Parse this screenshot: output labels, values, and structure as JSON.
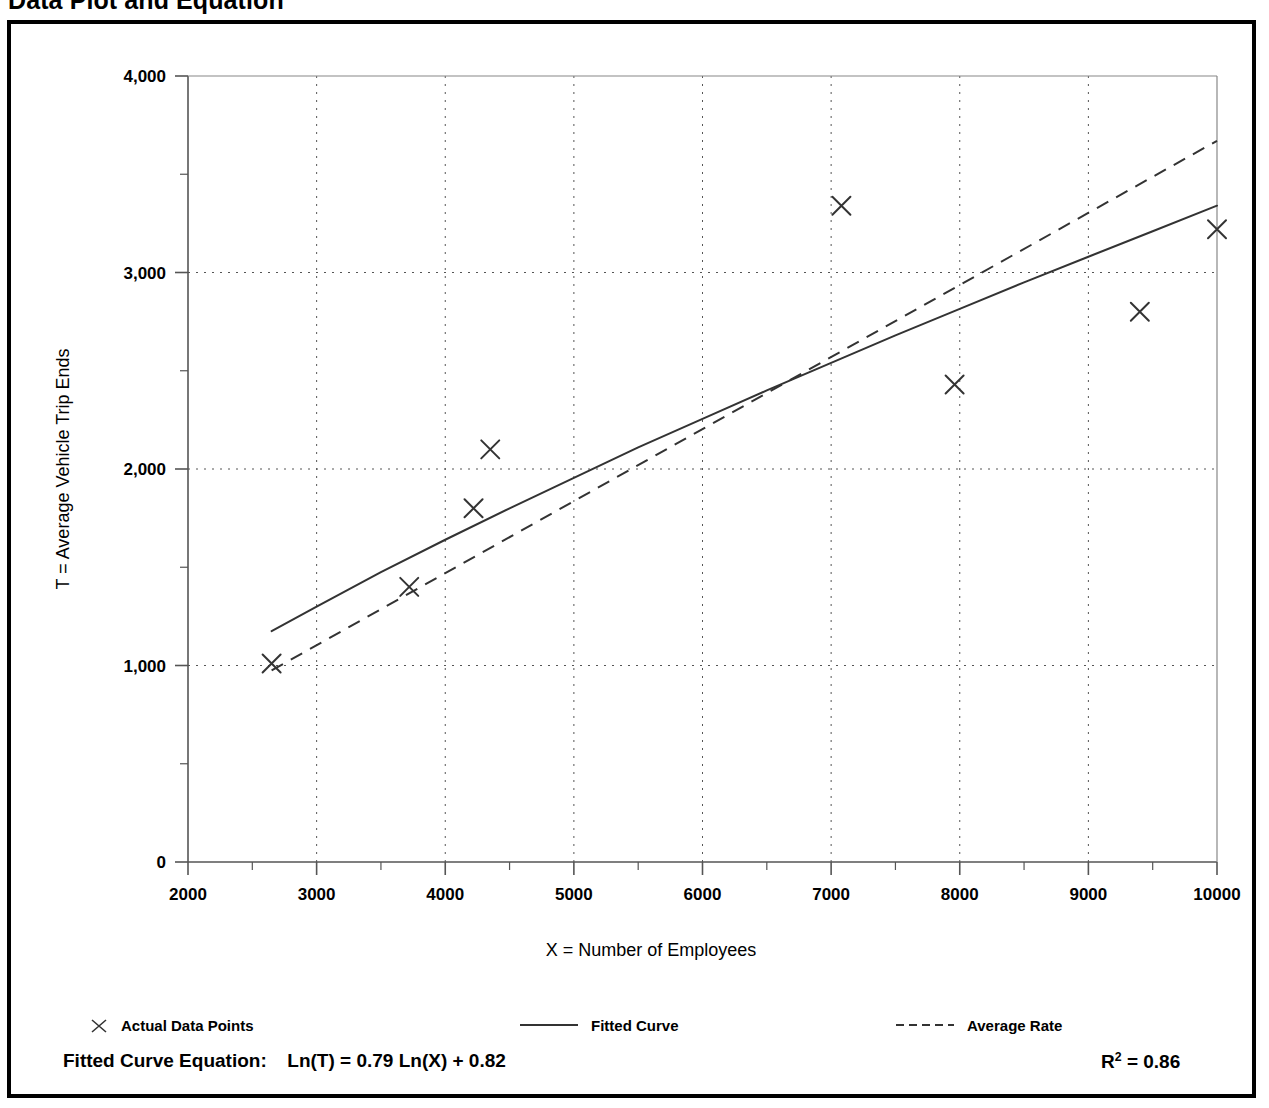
{
  "title": "Data Plot and Equation",
  "chart_data": {
    "type": "scatter",
    "title": "Data Plot and Equation",
    "xlabel": "X = Number of Employees",
    "ylabel": "T = Average Vehicle Trip Ends",
    "xlim": [
      2000,
      10000
    ],
    "ylim": [
      0,
      4000
    ],
    "grid": true,
    "x_ticks": [
      2000,
      3000,
      4000,
      5000,
      6000,
      7000,
      8000,
      9000,
      10000
    ],
    "x_tick_labels": [
      "2000",
      "3000",
      "4000",
      "5000",
      "6000",
      "7000",
      "8000",
      "9000",
      "10000"
    ],
    "x_minor_tick_step": 500,
    "y_ticks": [
      0,
      1000,
      2000,
      3000,
      4000
    ],
    "y_tick_labels": [
      "0",
      "1,000",
      "2,000",
      "3,000",
      "4,000"
    ],
    "y_minor_tick_step": 500,
    "gridline_values_y": [
      1000,
      2000,
      3000
    ],
    "legend_position": "below-axis",
    "series": [
      {
        "name": "Actual Data Points",
        "type": "scatter",
        "marker": "x",
        "points": [
          {
            "x": 2650,
            "y": 1010
          },
          {
            "x": 3720,
            "y": 1400
          },
          {
            "x": 4220,
            "y": 1800
          },
          {
            "x": 4350,
            "y": 2100
          },
          {
            "x": 7080,
            "y": 3340
          },
          {
            "x": 7960,
            "y": 2430
          },
          {
            "x": 9400,
            "y": 2800
          },
          {
            "x": 10000,
            "y": 3220
          }
        ]
      },
      {
        "name": "Fitted Curve",
        "type": "line",
        "style": "solid",
        "equation": "Ln(T) = 0.79 Ln(X) + 0.82",
        "coef_a": 0.82,
        "coef_b": 0.79,
        "x_start": 2650,
        "x_end": 10000,
        "points": [
          {
            "x": 2650,
            "y": 1175
          },
          {
            "x": 3000,
            "y": 1300
          },
          {
            "x": 3500,
            "y": 1475
          },
          {
            "x": 4000,
            "y": 1640
          },
          {
            "x": 4500,
            "y": 1800
          },
          {
            "x": 5000,
            "y": 1955
          },
          {
            "x": 5500,
            "y": 2110
          },
          {
            "x": 6000,
            "y": 2255
          },
          {
            "x": 6500,
            "y": 2400
          },
          {
            "x": 7000,
            "y": 2540
          },
          {
            "x": 7500,
            "y": 2680
          },
          {
            "x": 8000,
            "y": 2815
          },
          {
            "x": 8500,
            "y": 2950
          },
          {
            "x": 9000,
            "y": 3080
          },
          {
            "x": 9500,
            "y": 3210
          },
          {
            "x": 10000,
            "y": 3340
          }
        ]
      },
      {
        "name": "Average Rate",
        "type": "line",
        "style": "dashed",
        "points": [
          {
            "x": 2650,
            "y": 975
          },
          {
            "x": 10000,
            "y": 3670
          }
        ]
      }
    ]
  },
  "legend": {
    "actual_label": "Actual Data Points",
    "fitted_label": "Fitted Curve",
    "average_label": "Average Rate"
  },
  "equation": {
    "prefix": "Fitted Curve Equation:",
    "formula": "Ln(T) = 0.79 Ln(X) + 0.82",
    "r2_label": "R",
    "r2_exponent": "2",
    "r2_value": "= 0.86"
  }
}
